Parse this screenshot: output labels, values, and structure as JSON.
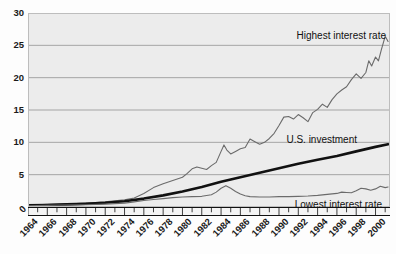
{
  "chart_data": {
    "type": "line",
    "title": "",
    "subtitle": "",
    "xlabel": "",
    "ylabel": "",
    "xlim": [
      1964,
      2001.5
    ],
    "ylim": [
      0,
      30
    ],
    "grid": true,
    "grid_axis": "y",
    "legend": "inline-annotations",
    "y_ticks": [
      0,
      5,
      10,
      15,
      20,
      25,
      30
    ],
    "y_tick_labels": [
      "0",
      "5",
      "10",
      "15",
      "20",
      "25",
      "30"
    ],
    "x_ticks": [
      1964,
      1966,
      1968,
      1970,
      1972,
      1974,
      1976,
      1978,
      1980,
      1982,
      1984,
      1986,
      1988,
      1990,
      1992,
      1994,
      1996,
      1998,
      2000
    ],
    "x_tick_labels": [
      "1964",
      "1966",
      "1968",
      "1970",
      "1972",
      "1974",
      "1976",
      "1978",
      "1980",
      "1982",
      "1984",
      "1986",
      "1988",
      "1990",
      "1992",
      "1994",
      "1996",
      "1998",
      "2000"
    ],
    "x_minor_tick_interval": 1,
    "annotations": [
      {
        "name": "highest-interest-rate-label",
        "text": "Highest interest rate",
        "x": 1999.0,
        "y": 27.6
      },
      {
        "name": "us-investment-label",
        "text": "U.S. investment",
        "x": 1994.0,
        "y": 11.5
      },
      {
        "name": "lowest-interest-rate-label",
        "text": "Lowest interest rate",
        "x": 1997.5,
        "y": 1.6
      }
    ],
    "series": [
      {
        "name": "Highest interest rate",
        "style": "thin-line",
        "color": "#6b6b6b",
        "x": [
          1964,
          1965,
          1966,
          1967,
          1968,
          1969,
          1970,
          1971,
          1972,
          1973,
          1974,
          1975,
          1976,
          1977,
          1978,
          1979,
          1980,
          1980.5,
          1981,
          1981.5,
          1982,
          1982.5,
          1983,
          1983.5,
          1984,
          1984.3,
          1984.6,
          1985,
          1985.5,
          1986,
          1986.5,
          1987,
          1987.5,
          1988,
          1988.5,
          1989,
          1989.5,
          1990,
          1990.5,
          1991,
          1991.5,
          1992,
          1992.5,
          1993,
          1993.5,
          1994,
          1994.5,
          1995,
          1995.5,
          1996,
          1996.5,
          1997,
          1997.5,
          1998,
          1998.5,
          1999,
          1999.3,
          1999.6,
          2000,
          2000.3,
          2000.6,
          2001,
          2001.3
        ],
        "values": [
          0.3,
          0.35,
          0.4,
          0.45,
          0.5,
          0.55,
          0.6,
          0.7,
          0.8,
          0.95,
          1.1,
          1.4,
          2.1,
          3.0,
          3.6,
          4.1,
          4.6,
          5.2,
          5.9,
          6.2,
          6.0,
          5.8,
          6.4,
          6.9,
          8.6,
          9.6,
          8.8,
          8.2,
          8.6,
          9.0,
          9.2,
          10.5,
          10.1,
          9.7,
          10.0,
          10.6,
          11.4,
          12.6,
          13.9,
          14.0,
          13.6,
          14.3,
          13.8,
          13.2,
          14.6,
          15.1,
          15.9,
          15.4,
          16.6,
          17.5,
          18.1,
          18.6,
          19.7,
          20.6,
          19.9,
          20.8,
          22.6,
          21.8,
          23.2,
          22.6,
          24.3,
          26.4,
          25.6
        ]
      },
      {
        "name": "U.S. investment",
        "style": "thick-line",
        "color": "#111111",
        "x": [
          1964,
          1966,
          1968,
          1970,
          1972,
          1974,
          1976,
          1978,
          1980,
          1982,
          1984,
          1986,
          1988,
          1990,
          1992,
          1994,
          1996,
          1998,
          2000,
          2001.3
        ],
        "values": [
          0.25,
          0.3,
          0.4,
          0.5,
          0.65,
          0.9,
          1.3,
          1.8,
          2.4,
          3.1,
          3.9,
          4.6,
          5.3,
          6.0,
          6.7,
          7.3,
          7.9,
          8.6,
          9.3,
          9.7
        ]
      },
      {
        "name": "Lowest interest rate",
        "style": "thin-line",
        "color": "#6b6b6b",
        "x": [
          1964,
          1966,
          1968,
          1970,
          1972,
          1974,
          1975,
          1976,
          1977,
          1978,
          1979,
          1980,
          1981,
          1982,
          1983,
          1983.5,
          1984,
          1984.5,
          1985,
          1985.5,
          1986,
          1986.5,
          1987,
          1988,
          1989,
          1990,
          1991,
          1992,
          1993,
          1994,
          1995,
          1996,
          1996.5,
          1997,
          1997.5,
          1998,
          1998.5,
          1999,
          1999.5,
          2000,
          2000.5,
          2001,
          2001.3
        ],
        "values": [
          0.2,
          0.25,
          0.3,
          0.35,
          0.45,
          0.6,
          0.8,
          1.0,
          1.15,
          1.3,
          1.45,
          1.55,
          1.6,
          1.65,
          1.9,
          2.3,
          2.9,
          3.3,
          2.9,
          2.4,
          2.0,
          1.75,
          1.6,
          1.55,
          1.55,
          1.6,
          1.6,
          1.65,
          1.7,
          1.8,
          1.95,
          2.1,
          2.3,
          2.25,
          2.2,
          2.5,
          2.9,
          2.8,
          2.6,
          2.8,
          3.2,
          3.0,
          3.1
        ]
      }
    ]
  },
  "axes": {
    "y_zero_label": "0"
  }
}
